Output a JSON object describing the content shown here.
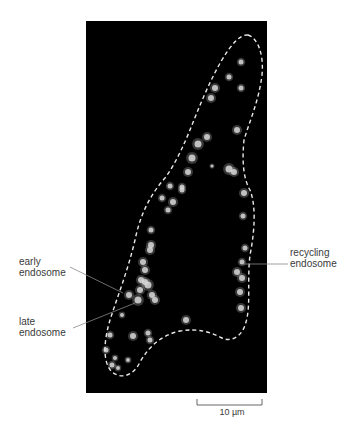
{
  "figure": {
    "type": "fluorescence micrograph",
    "panel": {
      "x": 86,
      "y": 21,
      "width": 181,
      "height": 372,
      "background": "#000000"
    },
    "outline_color": "#e8e8e8",
    "spot_color": "#d8d8d8"
  },
  "labels": {
    "early": {
      "line1": "early",
      "line2": "endosome"
    },
    "late": {
      "line1": "late",
      "line2": "endosome"
    },
    "recycling": {
      "line1": "recycling",
      "line2": "endosome"
    }
  },
  "scale_bar": {
    "label": "10 µm",
    "x1": 197,
    "x2": 262,
    "y": 405
  },
  "spots": [
    [
      241,
      62,
      2.5
    ],
    [
      229,
      77,
      2.5
    ],
    [
      215,
      88,
      3
    ],
    [
      241,
      88,
      2.5
    ],
    [
      211,
      98,
      3
    ],
    [
      237,
      130,
      3
    ],
    [
      207,
      137,
      3
    ],
    [
      198,
      144,
      3.5
    ],
    [
      192,
      158,
      3.5
    ],
    [
      188,
      172,
      3
    ],
    [
      229,
      169,
      3.5
    ],
    [
      234,
      172,
      3
    ],
    [
      212,
      166,
      1.5
    ],
    [
      244,
      193,
      3
    ],
    [
      182,
      190,
      2.5
    ],
    [
      170,
      186,
      2.5
    ],
    [
      182,
      187,
      2.5
    ],
    [
      162,
      198,
      2.5
    ],
    [
      173,
      202,
      3
    ],
    [
      168,
      210,
      2.5
    ],
    [
      151,
      230,
      2.5
    ],
    [
      151,
      245,
      3
    ],
    [
      150,
      250,
      3
    ],
    [
      143,
      262,
      3
    ],
    [
      145,
      270,
      3
    ],
    [
      141,
      280,
      3
    ],
    [
      148,
      285,
      3.5
    ],
    [
      140,
      290,
      3
    ],
    [
      152,
      295,
      3
    ],
    [
      155,
      300,
      3
    ],
    [
      129,
      295,
      3
    ],
    [
      138,
      300,
      3.5
    ],
    [
      145,
      282,
      3
    ],
    [
      122,
      315,
      2
    ],
    [
      110,
      335,
      2.5
    ],
    [
      133,
      336,
      3
    ],
    [
      148,
      333,
      2.5
    ],
    [
      150,
      340,
      2.5
    ],
    [
      106,
      350,
      2.5
    ],
    [
      115,
      358,
      2
    ],
    [
      128,
      360,
      2
    ],
    [
      112,
      365,
      2.5
    ],
    [
      118,
      368,
      2
    ],
    [
      186,
      320,
      3
    ],
    [
      243,
      216,
      2.5
    ],
    [
      245,
      248,
      2.5
    ],
    [
      242,
      262,
      2.5
    ],
    [
      237,
      272,
      3
    ],
    [
      242,
      278,
      3
    ],
    [
      240,
      292,
      3
    ],
    [
      241,
      308,
      3
    ]
  ]
}
